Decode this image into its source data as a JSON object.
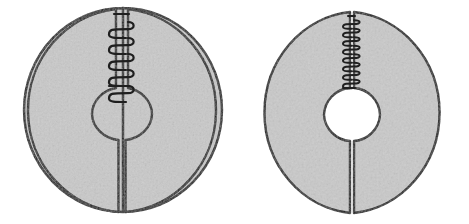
{
  "figure": {
    "background_color": "#ffffff",
    "width": 469,
    "height": 224,
    "ink_color": "#1a1a1a",
    "fill_color": "#c9c9c9",
    "hole_color": "#ffffff",
    "panel_count": 2
  },
  "panels": [
    {
      "id": "left-panel",
      "label": "Split ring, spring extended",
      "state": "extended",
      "disc": {
        "center_x": 123,
        "center_y": 110,
        "radius_x": 99,
        "radius_y": 102,
        "fill": "#c9c9c9",
        "stroke": "#1a1a1a",
        "stroke_width": 2.4
      },
      "hole": {
        "center_x": 122,
        "center_y": 114,
        "radius_x": 30,
        "radius_y": 27,
        "fill": "#ffffff",
        "stroke": "#1a1a1a",
        "stroke_width": 2.4
      },
      "upper_slit": {
        "gap_width": 12,
        "top_y": 9,
        "bottom_y": 88,
        "center_x": 122
      },
      "lower_slit": {
        "gap_width": 7,
        "top_y": 140,
        "bottom_y": 212,
        "center_x": 122
      },
      "spring": {
        "coil_count": 5,
        "coil_spacing": 16,
        "coil_width": 26,
        "stroke_width": 2.2,
        "stroke": "#1f1f1f",
        "compression": "loose",
        "top_y": 14,
        "bottom_y": 86
      }
    },
    {
      "id": "right-panel",
      "label": "Split ring, spring compressed",
      "state": "compressed",
      "disc": {
        "center_x": 353,
        "center_y": 112,
        "radius_x": 95,
        "radius_y": 101,
        "fill": "#c9c9c9",
        "stroke": "#1a1a1a",
        "stroke_width": 2.4
      },
      "hole": {
        "center_x": 352,
        "center_y": 115,
        "radius_x": 28,
        "radius_y": 28,
        "fill": "#ffffff",
        "stroke": "#1a1a1a",
        "stroke_width": 2.4
      },
      "upper_slit": {
        "gap_width": 4,
        "top_y": 12,
        "bottom_y": 88,
        "center_x": 352
      },
      "lower_slit": {
        "gap_width": 4,
        "top_y": 141,
        "bottom_y": 213,
        "center_x": 352
      },
      "spring": {
        "coil_count": 9,
        "coil_spacing": 8.5,
        "coil_width": 18,
        "stroke_width": 2.0,
        "stroke": "#1f1f1f",
        "compression": "tight",
        "top_y": 16,
        "bottom_y": 88
      }
    }
  ]
}
